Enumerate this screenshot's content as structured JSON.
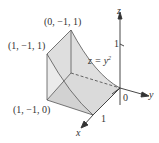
{
  "figure": {
    "axes": {
      "x_label": "x",
      "y_label": "y",
      "z_label": "z",
      "origin_label": "0",
      "z_tick": "1",
      "x_tick": "1"
    },
    "points": [
      {
        "label": "(0, −1, 1)"
      },
      {
        "label": "(1, −1, 1)"
      },
      {
        "label": "(1, −1, 0)"
      }
    ],
    "surface": {
      "equation_lhs": "z = y",
      "equation_exp": "2"
    },
    "colors": {
      "line": "#333333",
      "fill_light": "#e6e6e6",
      "fill_dark": "#cfcfcf",
      "dashed": "#444444"
    }
  }
}
